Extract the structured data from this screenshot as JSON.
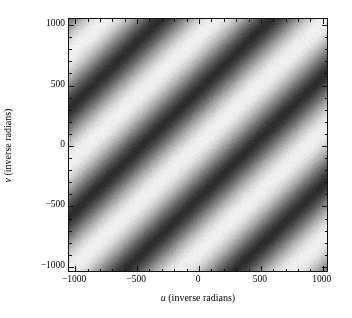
{
  "figure": {
    "background_color": "#ffffff",
    "foreground_color": "#000000"
  },
  "axes": {
    "frame_color": "#111111",
    "x": {
      "label_variable": "u",
      "label_units": "(inverse radians)",
      "label_full": "u (inverse radians)",
      "tick_labels": [
        "−1000",
        "−500",
        "0",
        "500",
        "1000"
      ],
      "tick_values": [
        -1000,
        -500,
        0,
        500,
        1000
      ],
      "minor_tick_step": 100,
      "limits": [
        -1050,
        1050
      ]
    },
    "y": {
      "label_variable": "v",
      "label_units": "(inverse radians)",
      "label_full": "v (inverse radians)",
      "tick_labels": [
        "−1000",
        "−500",
        "0",
        "500",
        "1000"
      ],
      "tick_values": [
        -1000,
        -500,
        0,
        500,
        1000
      ],
      "minor_tick_step": 100,
      "limits": [
        -1050,
        1050
      ]
    }
  },
  "chart_data": {
    "type": "heatmap",
    "title": "",
    "subtitle": "",
    "xlabel": "u (inverse radians)",
    "ylabel": "v (inverse radians)",
    "xlim": [
      -1050,
      1050
    ],
    "ylim": [
      -1050,
      1050
    ],
    "xticks": [
      -1000,
      -500,
      0,
      500,
      1000
    ],
    "yticks": [
      -1000,
      -500,
      0,
      500,
      1000
    ],
    "xticklabels": [
      "−1000",
      "−500",
      "0",
      "500",
      "1000"
    ],
    "yticklabels": [
      "−1000",
      "−500",
      "0",
      "500",
      "1000"
    ],
    "grid": false,
    "legend": false,
    "colorbar": false,
    "colormap": "gray_r",
    "colormap_low_hex": "#f2f2f2",
    "colormap_high_hex": "#2b2b2b",
    "value_range": [
      0.0,
      1.0
    ],
    "noise_amplitude": 0.035,
    "pattern": {
      "form": "amplitude = 0.5 + 0.5*cos(2*pi*(u - v - phase0)/period)",
      "projection_axis": "u_minus_v",
      "period_inverse_radians": 900,
      "phase0_inverse_radians": 0,
      "band_orientation_degrees": 45,
      "dark_band_centers_u_minus_v": [
        -1350,
        -450,
        450,
        1350
      ],
      "bright_band_centers_u_minus_v": [
        -1800,
        -900,
        0,
        900,
        1800
      ],
      "bright_value": 1.0,
      "dark_value": 0.0
    },
    "sample_profile": {
      "axis": "u_minus_v",
      "x": [
        -2100,
        -1800,
        -1500,
        -1350,
        -1200,
        -900,
        -600,
        -450,
        -300,
        0,
        300,
        450,
        600,
        900,
        1200,
        1350,
        1500,
        1800,
        2100
      ],
      "brightness": [
        0.25,
        1.0,
        0.25,
        0.0,
        0.25,
        1.0,
        0.25,
        0.0,
        0.25,
        1.0,
        0.25,
        0.0,
        0.25,
        1.0,
        0.25,
        0.0,
        0.25,
        1.0,
        0.25
      ]
    }
  }
}
